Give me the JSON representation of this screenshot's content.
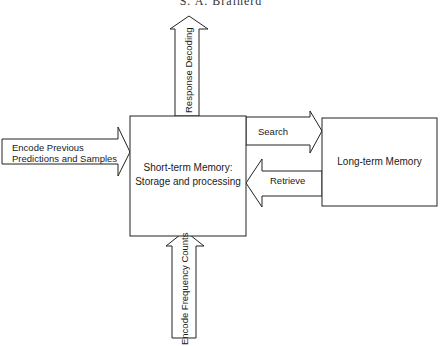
{
  "header": {
    "running_head": "S. A. Brainerd"
  },
  "diagram": {
    "nodes": [
      {
        "id": "stm",
        "label_line1": "Short-term Memory:",
        "label_line2": "Storage and processing"
      },
      {
        "id": "ltm",
        "label": "Long-term Memory"
      }
    ],
    "arrows": {
      "response_decoding": {
        "label": "Response Decoding",
        "from": "stm",
        "to": "output",
        "direction": "up"
      },
      "encode_previous": {
        "label_line1": "Encode Previous",
        "label_line2": "Predictions and Samples",
        "from": "input",
        "to": "stm",
        "direction": "right"
      },
      "search": {
        "label": "Search",
        "from": "stm",
        "to": "ltm",
        "direction": "right"
      },
      "retrieve": {
        "label": "Retrieve",
        "from": "ltm",
        "to": "stm",
        "direction": "left"
      },
      "encode_frequency": {
        "label": "Encode Frequency Counts",
        "from": "input",
        "to": "stm",
        "direction": "up"
      }
    }
  }
}
